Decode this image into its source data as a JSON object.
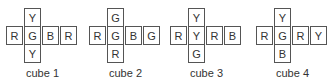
{
  "cubes": [
    {
      "label": "cube 1",
      "top": "Y",
      "row": [
        "R",
        "G",
        "B",
        "R"
      ],
      "bottom": "Y"
    },
    {
      "label": "cube 2",
      "top": "G",
      "row": [
        "R",
        "G",
        "B",
        "G"
      ],
      "bottom": "R"
    },
    {
      "label": "cube 3",
      "top": "Y",
      "row": [
        "R",
        "Y",
        "R",
        "B"
      ],
      "bottom": "G"
    },
    {
      "label": "cube 4",
      "top": "Y",
      "row": [
        "R",
        "G",
        "R",
        "Y"
      ],
      "bottom": "B"
    }
  ]
}
